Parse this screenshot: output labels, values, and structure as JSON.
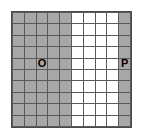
{
  "figure": {
    "name": "shaded-grid-diagram",
    "background_color": "#ffffff",
    "border_color": "#4a4a4a",
    "gridline_color": "#5a5a5a",
    "shaded_color": "#a8a8a8",
    "unshaded_color": "#ffffff",
    "columns": 10,
    "rows": 10,
    "shaded_columns": [
      0,
      1,
      2,
      3,
      4,
      9
    ],
    "unshaded_columns": [
      5,
      6,
      7,
      8
    ],
    "labels": [
      {
        "text": "O",
        "column": 2,
        "row": 4
      },
      {
        "text": "P",
        "column": 9,
        "row": 4
      }
    ],
    "cells": [
      [
        {
          "shaded": true,
          "label": ""
        },
        {
          "shaded": true,
          "label": ""
        },
        {
          "shaded": true,
          "label": ""
        },
        {
          "shaded": true,
          "label": ""
        },
        {
          "shaded": true,
          "label": ""
        },
        {
          "shaded": false,
          "label": ""
        },
        {
          "shaded": false,
          "label": ""
        },
        {
          "shaded": false,
          "label": ""
        },
        {
          "shaded": false,
          "label": ""
        },
        {
          "shaded": true,
          "label": ""
        }
      ],
      [
        {
          "shaded": true,
          "label": ""
        },
        {
          "shaded": true,
          "label": ""
        },
        {
          "shaded": true,
          "label": ""
        },
        {
          "shaded": true,
          "label": ""
        },
        {
          "shaded": true,
          "label": ""
        },
        {
          "shaded": false,
          "label": ""
        },
        {
          "shaded": false,
          "label": ""
        },
        {
          "shaded": false,
          "label": ""
        },
        {
          "shaded": false,
          "label": ""
        },
        {
          "shaded": true,
          "label": ""
        }
      ],
      [
        {
          "shaded": true,
          "label": ""
        },
        {
          "shaded": true,
          "label": ""
        },
        {
          "shaded": true,
          "label": ""
        },
        {
          "shaded": true,
          "label": ""
        },
        {
          "shaded": true,
          "label": ""
        },
        {
          "shaded": false,
          "label": ""
        },
        {
          "shaded": false,
          "label": ""
        },
        {
          "shaded": false,
          "label": ""
        },
        {
          "shaded": false,
          "label": ""
        },
        {
          "shaded": true,
          "label": ""
        }
      ],
      [
        {
          "shaded": true,
          "label": ""
        },
        {
          "shaded": true,
          "label": ""
        },
        {
          "shaded": true,
          "label": ""
        },
        {
          "shaded": true,
          "label": ""
        },
        {
          "shaded": true,
          "label": ""
        },
        {
          "shaded": false,
          "label": ""
        },
        {
          "shaded": false,
          "label": ""
        },
        {
          "shaded": false,
          "label": ""
        },
        {
          "shaded": false,
          "label": ""
        },
        {
          "shaded": true,
          "label": ""
        }
      ],
      [
        {
          "shaded": true,
          "label": ""
        },
        {
          "shaded": true,
          "label": ""
        },
        {
          "shaded": true,
          "label": "O"
        },
        {
          "shaded": true,
          "label": ""
        },
        {
          "shaded": true,
          "label": ""
        },
        {
          "shaded": false,
          "label": ""
        },
        {
          "shaded": false,
          "label": ""
        },
        {
          "shaded": false,
          "label": ""
        },
        {
          "shaded": false,
          "label": ""
        },
        {
          "shaded": true,
          "label": "P"
        }
      ],
      [
        {
          "shaded": true,
          "label": ""
        },
        {
          "shaded": true,
          "label": ""
        },
        {
          "shaded": true,
          "label": ""
        },
        {
          "shaded": true,
          "label": ""
        },
        {
          "shaded": true,
          "label": ""
        },
        {
          "shaded": false,
          "label": ""
        },
        {
          "shaded": false,
          "label": ""
        },
        {
          "shaded": false,
          "label": ""
        },
        {
          "shaded": false,
          "label": ""
        },
        {
          "shaded": true,
          "label": ""
        }
      ],
      [
        {
          "shaded": true,
          "label": ""
        },
        {
          "shaded": true,
          "label": ""
        },
        {
          "shaded": true,
          "label": ""
        },
        {
          "shaded": true,
          "label": ""
        },
        {
          "shaded": true,
          "label": ""
        },
        {
          "shaded": false,
          "label": ""
        },
        {
          "shaded": false,
          "label": ""
        },
        {
          "shaded": false,
          "label": ""
        },
        {
          "shaded": false,
          "label": ""
        },
        {
          "shaded": true,
          "label": ""
        }
      ],
      [
        {
          "shaded": true,
          "label": ""
        },
        {
          "shaded": true,
          "label": ""
        },
        {
          "shaded": true,
          "label": ""
        },
        {
          "shaded": true,
          "label": ""
        },
        {
          "shaded": true,
          "label": ""
        },
        {
          "shaded": false,
          "label": ""
        },
        {
          "shaded": false,
          "label": ""
        },
        {
          "shaded": false,
          "label": ""
        },
        {
          "shaded": false,
          "label": ""
        },
        {
          "shaded": true,
          "label": ""
        }
      ],
      [
        {
          "shaded": true,
          "label": ""
        },
        {
          "shaded": true,
          "label": ""
        },
        {
          "shaded": true,
          "label": ""
        },
        {
          "shaded": true,
          "label": ""
        },
        {
          "shaded": true,
          "label": ""
        },
        {
          "shaded": false,
          "label": ""
        },
        {
          "shaded": false,
          "label": ""
        },
        {
          "shaded": false,
          "label": ""
        },
        {
          "shaded": false,
          "label": ""
        },
        {
          "shaded": true,
          "label": ""
        }
      ],
      [
        {
          "shaded": true,
          "label": ""
        },
        {
          "shaded": true,
          "label": ""
        },
        {
          "shaded": true,
          "label": ""
        },
        {
          "shaded": true,
          "label": ""
        },
        {
          "shaded": true,
          "label": ""
        },
        {
          "shaded": false,
          "label": ""
        },
        {
          "shaded": false,
          "label": ""
        },
        {
          "shaded": false,
          "label": ""
        },
        {
          "shaded": false,
          "label": ""
        },
        {
          "shaded": true,
          "label": ""
        }
      ]
    ]
  }
}
